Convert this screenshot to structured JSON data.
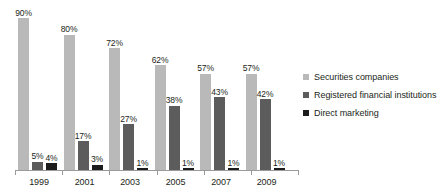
{
  "chart_data": {
    "type": "bar",
    "title": "",
    "subtitle": "",
    "xlabel": "",
    "ylabel": "",
    "ylim": [
      0,
      90
    ],
    "grid": false,
    "legend_position": "right",
    "value_suffix": "%",
    "categories": [
      "1999",
      "2001",
      "2003",
      "2005",
      "2007",
      "2009"
    ],
    "series": [
      {
        "name": "Securities companies",
        "color": "#b9b9b9",
        "values": [
          90,
          80,
          72,
          62,
          57,
          57
        ],
        "labels": [
          "90%",
          "80%",
          "72%",
          "62%",
          "57%",
          "57%"
        ]
      },
      {
        "name": "Registered financial institutions",
        "color": "#5c5c5c",
        "values": [
          5,
          17,
          27,
          38,
          43,
          42
        ],
        "labels": [
          "5%",
          "17%",
          "27%",
          "38%",
          "43%",
          "42%"
        ]
      },
      {
        "name": "Direct marketing",
        "color": "#1c1c1c",
        "values": [
          4,
          3,
          1,
          1,
          1,
          1
        ],
        "labels": [
          "4%",
          "3%",
          "1%",
          "1%",
          "1%",
          "1%"
        ]
      }
    ]
  },
  "axis": {
    "tick_labels": [
      "1999",
      "2001",
      "2003",
      "2005",
      "2007",
      "2009"
    ]
  },
  "legend": {
    "items": [
      {
        "label": "Securities companies",
        "color": "#b9b9b9"
      },
      {
        "label": "Registered financial institutions",
        "color": "#5c5c5c"
      },
      {
        "label": "Direct marketing",
        "color": "#1c1c1c"
      }
    ]
  }
}
